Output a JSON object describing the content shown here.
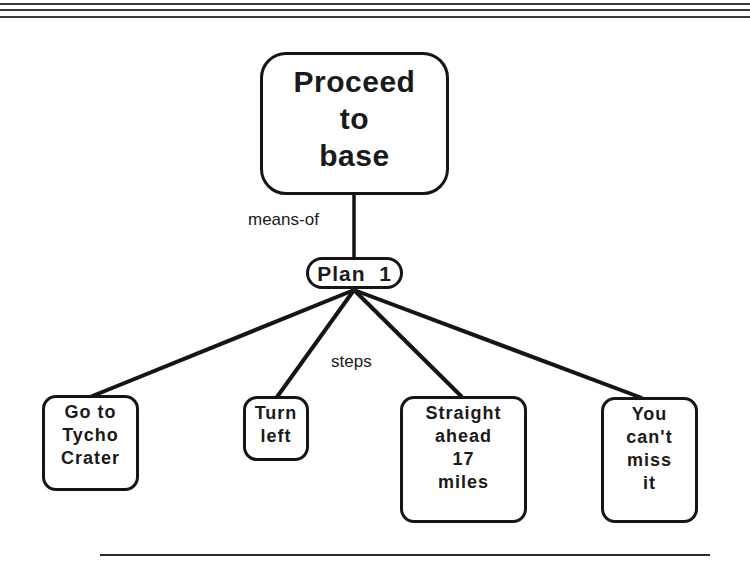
{
  "header": {
    "rules": 3
  },
  "diagram": {
    "root": {
      "lines": [
        "Proceed",
        "to",
        "base"
      ]
    },
    "edge_labels": {
      "means_of": "means-of",
      "steps": "steps"
    },
    "plan": {
      "label": "Plan  1"
    },
    "steps": [
      {
        "lines": [
          "Go to",
          "Tycho",
          "Crater"
        ]
      },
      {
        "lines": [
          "Turn",
          "left"
        ]
      },
      {
        "lines": [
          "Straight",
          "ahead",
          "17",
          "miles"
        ]
      },
      {
        "lines": [
          "You",
          "can't",
          "miss",
          "it"
        ]
      }
    ]
  },
  "colors": {
    "ink": "#151515",
    "background": "#ffffff"
  }
}
